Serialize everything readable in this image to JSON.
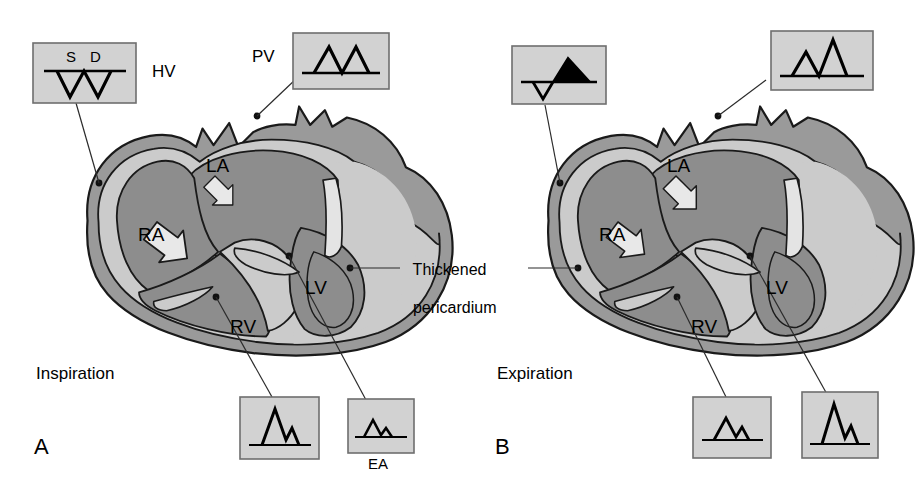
{
  "figure": {
    "type": "medical-diagram",
    "center_annotation_line1": "Thickened",
    "center_annotation_line2": "pericardium"
  },
  "colors": {
    "background": "#ffffff",
    "box_fill": "#d2d2d2",
    "box_border": "#6e6e6e",
    "chamber_fill": "#8d8d8d",
    "chamber_dark": "#7a7a7a",
    "myocardium_fill": "#cbcbcb",
    "pericardium_fill": "#9a9a9a",
    "outline": "#1a1a1a",
    "arrow_fill": "#e8e8e8",
    "waveform_stroke": "#000000",
    "leader_line": "#2b2b2b",
    "text": "#000000"
  },
  "panels": [
    {
      "id": "A",
      "panel_label": "A",
      "phase_label": "Inspiration",
      "chambers": [
        {
          "name": "RA",
          "label": "RA"
        },
        {
          "name": "LA",
          "label": "LA"
        },
        {
          "name": "RV",
          "label": "RV"
        },
        {
          "name": "LV",
          "label": "LV"
        }
      ],
      "flow_arrows": [
        {
          "name": "ra-to-rv-arrow",
          "chamber": "RA",
          "emphasis": "increased"
        },
        {
          "name": "la-to-lv-arrow",
          "chamber": "LA",
          "emphasis": "decreased"
        }
      ],
      "waveform_boxes": [
        {
          "name": "hepatic-vein-box",
          "site": "HV",
          "site_label": "HV",
          "wave_labels": [
            "S",
            "D"
          ],
          "description": "Hepatic vein systolic and diastolic forward flow below baseline, W shaped",
          "baseline_y": 0,
          "polarity": "below-baseline",
          "peaks": [
            {
              "label": "S",
              "value": -26
            },
            {
              "label": "D",
              "value": -26
            }
          ],
          "filled_reversal": false
        },
        {
          "name": "pulmonary-vein-box",
          "site": "PV",
          "site_label": "PV",
          "wave_labels": [],
          "description": "Pulmonary vein S and D peaks above baseline, both reduced and equal",
          "baseline_y": 0,
          "polarity": "above-baseline",
          "peaks": [
            {
              "label": "S",
              "value": 22
            },
            {
              "label": "D",
              "value": 22
            }
          ],
          "filled_reversal": false
        },
        {
          "name": "tricuspid-inflow-box",
          "site": "tricuspid",
          "site_label": "",
          "wave_labels": [],
          "description": "Tricuspid inflow with tall E wave and smaller A wave — increased on inspiration",
          "baseline_y": 0,
          "polarity": "above-baseline",
          "peaks": [
            {
              "label": "E",
              "value": 34
            },
            {
              "label": "A",
              "value": 17
            }
          ],
          "filled_reversal": false
        },
        {
          "name": "mitral-inflow-box",
          "site": "mitral",
          "site_label": "EA",
          "wave_labels": [
            "E",
            "A"
          ],
          "description": "Mitral inflow with small E and A waves — decreased on inspiration",
          "baseline_y": 0,
          "polarity": "above-baseline",
          "peaks": [
            {
              "label": "E",
              "value": 14
            },
            {
              "label": "A",
              "value": 8
            }
          ],
          "filled_reversal": false
        }
      ]
    },
    {
      "id": "B",
      "panel_label": "B",
      "phase_label": "Expiration",
      "chambers": [
        {
          "name": "RA",
          "label": "RA"
        },
        {
          "name": "LA",
          "label": "LA"
        },
        {
          "name": "RV",
          "label": "RV"
        },
        {
          "name": "LV",
          "label": "LV"
        }
      ],
      "flow_arrows": [
        {
          "name": "ra-to-rv-arrow",
          "chamber": "RA",
          "emphasis": "decreased"
        },
        {
          "name": "la-to-lv-arrow",
          "chamber": "LA",
          "emphasis": "increased"
        }
      ],
      "waveform_boxes": [
        {
          "name": "hepatic-vein-box",
          "site": "HV",
          "site_label": "",
          "wave_labels": [],
          "description": "Hepatic vein small forward flow with prominent filled diastolic flow reversal above baseline",
          "baseline_y": 0,
          "polarity": "mixed",
          "peaks": [
            {
              "label": "S",
              "value": -16
            },
            {
              "label": "DR",
              "value": 30
            }
          ],
          "filled_reversal": true
        },
        {
          "name": "pulmonary-vein-box",
          "site": "PV",
          "site_label": "",
          "wave_labels": [],
          "description": "Pulmonary vein with small S peak and tall D peak above baseline",
          "baseline_y": 0,
          "polarity": "above-baseline",
          "peaks": [
            {
              "label": "S",
              "value": 20
            },
            {
              "label": "D",
              "value": 36
            }
          ],
          "filled_reversal": false
        },
        {
          "name": "tricuspid-inflow-box",
          "site": "tricuspid",
          "site_label": "",
          "wave_labels": [],
          "description": "Tricuspid inflow with small E and A waves — decreased on expiration",
          "baseline_y": 0,
          "polarity": "above-baseline",
          "peaks": [
            {
              "label": "E",
              "value": 17
            },
            {
              "label": "A",
              "value": 11
            }
          ],
          "filled_reversal": false
        },
        {
          "name": "mitral-inflow-box",
          "site": "mitral",
          "site_label": "",
          "wave_labels": [],
          "description": "Mitral inflow with tall E wave and smaller A wave — increased on expiration",
          "baseline_y": 0,
          "polarity": "above-baseline",
          "peaks": [
            {
              "label": "E",
              "value": 34
            },
            {
              "label": "A",
              "value": 18
            }
          ],
          "filled_reversal": false
        }
      ]
    }
  ]
}
